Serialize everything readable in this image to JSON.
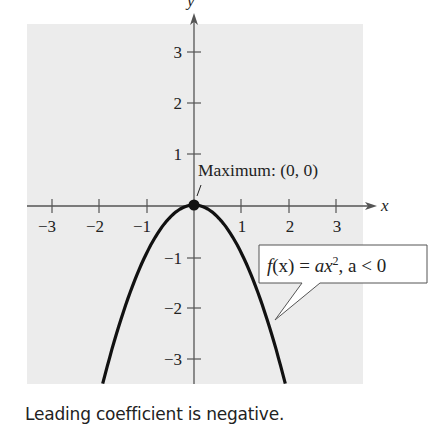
{
  "chart_data": {
    "type": "line",
    "title": "",
    "function": "f(x) = -x^2",
    "xlabel": "x",
    "ylabel": "y",
    "xlim": [
      -3.5,
      3.5
    ],
    "ylim": [
      -3.5,
      3.5
    ],
    "x_ticks": [
      -3,
      -2,
      -1,
      1,
      2,
      3
    ],
    "x_tick_labels": [
      "−3",
      "−2",
      "−1",
      "1",
      "2",
      "3"
    ],
    "y_ticks": [
      3,
      2,
      1,
      -1,
      -2,
      -3
    ],
    "y_tick_labels": [
      "3",
      "2",
      "1",
      "−1",
      "−2",
      "−3"
    ],
    "series": [
      {
        "name": "f(x) = ax^2, a < 0",
        "x": [
          -1.93,
          -1.5,
          -1,
          -0.5,
          0,
          0.5,
          1,
          1.5,
          1.93
        ],
        "y": [
          -3.5,
          -2.25,
          -1,
          -0.25,
          0,
          -0.25,
          -1,
          -2.25,
          -3.5
        ]
      }
    ],
    "points": [
      {
        "x": 0,
        "y": 0,
        "label": "Maximum: (0, 0)"
      }
    ],
    "annotations": [
      {
        "text": "Maximum: (0, 0)",
        "target": [
          0,
          0
        ]
      },
      {
        "text": "f(x) = ax², a < 0",
        "type": "callout"
      }
    ],
    "grid": false,
    "legend": "none"
  },
  "labels": {
    "x_axis": "x",
    "y_axis": "y",
    "maximum": "Maximum: (0, 0)",
    "callout_f": "f",
    "callout_x": "(x) = ",
    "callout_ax": "ax",
    "callout_sup": "2",
    "callout_rest": ", a < 0",
    "caption": "Leading coefficient is negative."
  },
  "colors": {
    "panel": "#ececec",
    "axis": "#555555",
    "curve": "#111111",
    "text": "#222222"
  }
}
